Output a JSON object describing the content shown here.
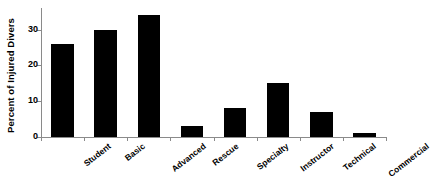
{
  "chart_data": {
    "type": "bar",
    "title": "",
    "xlabel": "",
    "ylabel": "Percent of Injured Divers",
    "categories": [
      "Student",
      "Basic",
      "Advanced",
      "Rescue",
      "Specialty",
      "Instructor",
      "Technical",
      "Commercial"
    ],
    "values": [
      26,
      30,
      34,
      3,
      8,
      15,
      7,
      1
    ],
    "ylim": [
      0,
      36
    ],
    "yticks": [
      0,
      10,
      20,
      30
    ],
    "ytick_labels": [
      "0",
      "10",
      "20",
      "30"
    ],
    "grid": false,
    "legend": null,
    "bar_color": "#000000",
    "axis_color": "#8a8a8a",
    "background_color": "#ffffff",
    "text_color": "#000000"
  }
}
